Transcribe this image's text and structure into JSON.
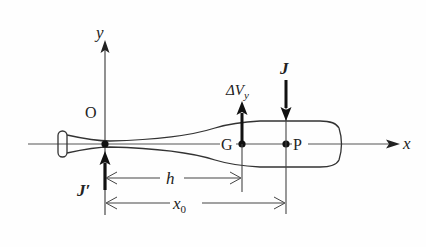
{
  "diagram": {
    "type": "physics-free-body",
    "axes": {
      "x_label": "x",
      "y_label": "y",
      "origin_label": "O"
    },
    "points": {
      "center_of_mass": "G",
      "impact_point": "P"
    },
    "vectors": {
      "impulse": "J",
      "reaction_impulse": "J′",
      "velocity_change": "ΔV",
      "velocity_change_subscript": "y"
    },
    "dimensions": {
      "h_label": "h",
      "x0_label": "x",
      "x0_subscript": "0"
    },
    "colors": {
      "line": "#333333",
      "axis": "#555555",
      "arrow": "#111111"
    }
  }
}
